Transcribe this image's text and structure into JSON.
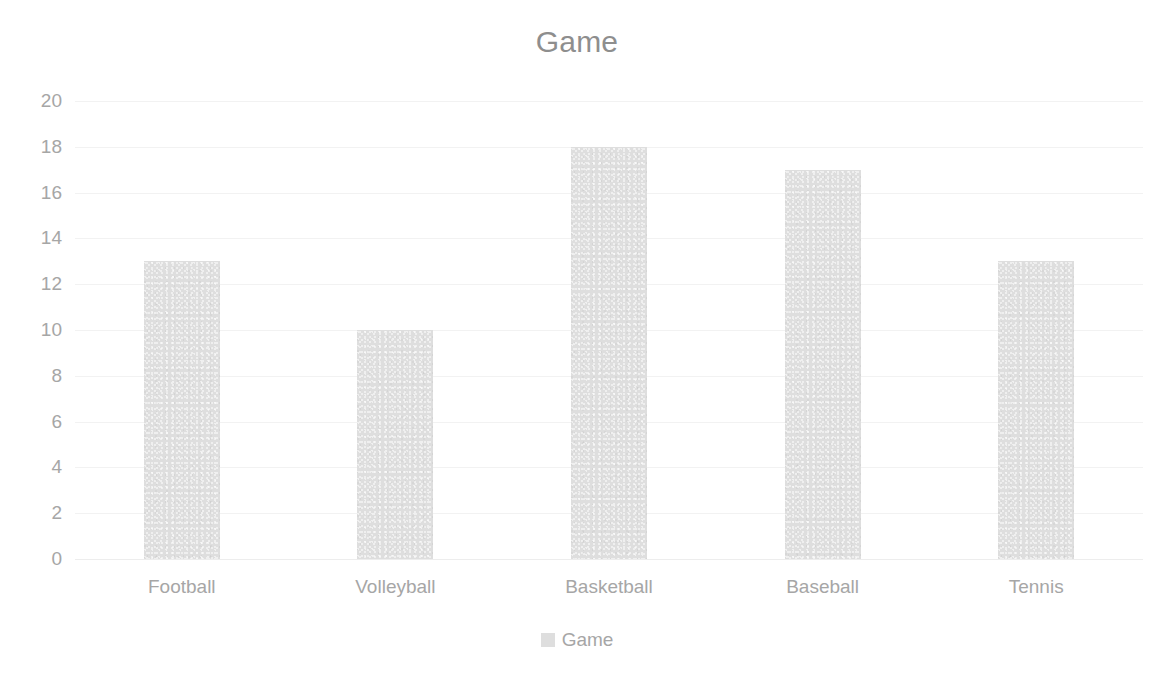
{
  "chart_data": {
    "type": "bar",
    "title": "Game",
    "xlabel": "",
    "ylabel": "",
    "categories": [
      "Football",
      "Volleyball",
      "Basketball",
      "Baseball",
      "Tennis"
    ],
    "values": [
      13,
      10,
      18,
      17,
      13
    ],
    "series": [
      {
        "name": "Game",
        "values": [
          13,
          10,
          18,
          17,
          13
        ]
      }
    ],
    "ylim": [
      0,
      20
    ],
    "ytick_step": 2,
    "yticks": [
      20,
      18,
      16,
      14,
      12,
      10,
      8,
      6,
      4,
      2,
      0
    ],
    "grid": true,
    "grid_axis": "y",
    "legend": {
      "position": "bottom",
      "entries": [
        "Game"
      ]
    },
    "colors": {
      "bar": "#dedede",
      "title_text": "#8e8e8e",
      "tick_text": "#a6a6a6",
      "gridline": "#f2f2f2",
      "background": "#ffffff"
    }
  }
}
